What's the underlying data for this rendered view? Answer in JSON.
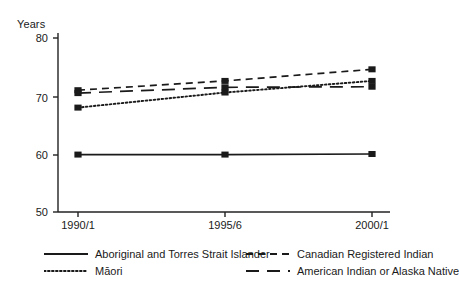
{
  "chart_data": {
    "type": "line",
    "title": "",
    "xlabel": "",
    "ylabel": "Years",
    "categories": [
      "1990/1",
      "1995/6",
      "2000/1"
    ],
    "ylim": [
      50,
      80
    ],
    "yticks": [
      50,
      60,
      70,
      80
    ],
    "ytick_labels": [
      "50",
      "60",
      "70",
      "80"
    ],
    "grid": false,
    "legend_position": "bottom",
    "series": [
      {
        "name": "Aboriginal and Torres Strait Islander",
        "style": "solid",
        "values": [
          59.9,
          59.9,
          60.0
        ]
      },
      {
        "name": "Māori",
        "style": "dotted",
        "values": [
          68.0,
          70.6,
          72.6
        ]
      },
      {
        "name": "Canadian Registered Indian",
        "style": "dashed-short",
        "values": [
          71.0,
          72.6,
          74.6
        ]
      },
      {
        "name": "American Indian or Alaska Native",
        "style": "dashed-long",
        "values": [
          70.5,
          71.5,
          71.6
        ]
      }
    ]
  },
  "axes": {
    "y_title": "Years",
    "y_tick_labels": [
      "80",
      "70",
      "60",
      "50"
    ],
    "x_tick_labels": [
      "1990/1",
      "1995/6",
      "2000/1"
    ]
  },
  "legend": {
    "left_column": [
      {
        "label": "Aboriginal and Torres Strait Islander",
        "style": "solid"
      },
      {
        "label": "Māori",
        "style": "dotted"
      }
    ],
    "right_column": [
      {
        "label": "Canadian Registered Indian",
        "style": "dashed-short"
      },
      {
        "label": "American Indian or Alaska Native",
        "style": "dashed-long"
      }
    ]
  },
  "colors": {
    "ink": "#1a1a1a",
    "axis": "#222222",
    "background": "#ffffff"
  }
}
